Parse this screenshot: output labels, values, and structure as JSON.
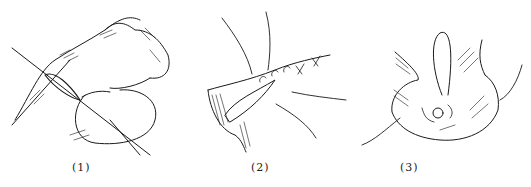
{
  "figure": {
    "panels": [
      {
        "id": "panel-1",
        "caption": "(1)",
        "subject": "wound-edges-with-crossing-needles-and-suture-loop"
      },
      {
        "id": "panel-2",
        "caption": "(2)",
        "subject": "continuous-suture-with-loose-thread-ends"
      },
      {
        "id": "panel-3",
        "caption": "(3)",
        "subject": "purse-string-closure-with-looped-thread"
      }
    ],
    "colors": {
      "ink": "#1a1a1a",
      "background": "#ffffff"
    }
  }
}
